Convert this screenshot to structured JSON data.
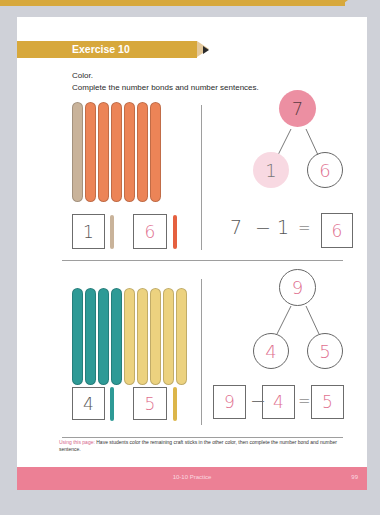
{
  "page": {
    "exercise_title": "Exercise 10",
    "instruction_1": "Color.",
    "instruction_2": "Complete the number bonds and number sentences.",
    "teacher_note_lead": "Using this page:",
    "teacher_note_body": "Have students color the remaining craft sticks in the other color, then complete the number bond and number sentence.",
    "footer_title": "10-10 Practice",
    "footer_page": "99"
  },
  "colors": {
    "banner": "#d7a83c",
    "footer": "#ec8095",
    "stick_tan": "#c9b39a",
    "stick_orange": "#ec8457",
    "stick_teal": "#2e9a96",
    "stick_yellow": "#ecd27f",
    "bond_pink_dark": "#ec8fa2",
    "bond_pink_light": "#f8d9e2",
    "answer_pink": "#e0708f"
  },
  "problem_1": {
    "sticks": [
      "tan",
      "orange",
      "orange",
      "orange",
      "orange",
      "orange",
      "orange"
    ],
    "part_a_box": "1",
    "part_a_color": "tan",
    "part_b_box": "6",
    "part_b_color": "orange",
    "bond_whole": "7",
    "bond_part_left": "1",
    "bond_part_right": "6",
    "sentence": {
      "left": "7",
      "op": "−",
      "middle": "1",
      "eq": "=",
      "answer": "6"
    }
  },
  "problem_2": {
    "sticks": [
      "teal",
      "teal",
      "teal",
      "teal",
      "yellow",
      "yellow",
      "yellow",
      "yellow",
      "yellow"
    ],
    "part_a_box": "4",
    "part_a_color": "teal",
    "part_b_box": "5",
    "part_b_color": "yellow",
    "bond_whole": "9",
    "bond_part_left": "4",
    "bond_part_right": "5",
    "sentence": {
      "left": "9",
      "op": "−",
      "middle": "4",
      "eq": "=",
      "answer": "5"
    }
  }
}
